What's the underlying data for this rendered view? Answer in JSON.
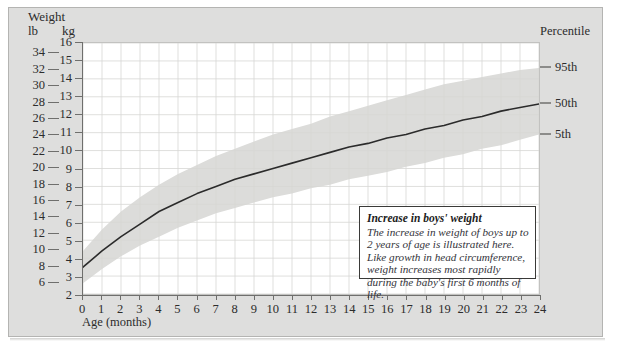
{
  "card": {
    "background_color": "#dededd",
    "border_color": "#b4b4b2"
  },
  "header": {
    "weight_label": "Weight",
    "lb_label": "lb",
    "kg_label": "kg",
    "percentile_label": "Percentile"
  },
  "axes": {
    "x_title": "Age (months)",
    "x_ticks": [
      0,
      1,
      2,
      3,
      4,
      5,
      6,
      7,
      8,
      9,
      10,
      11,
      12,
      13,
      14,
      15,
      16,
      17,
      18,
      19,
      20,
      21,
      22,
      23,
      24
    ],
    "kg_ticks": [
      2,
      3,
      4,
      5,
      6,
      7,
      8,
      9,
      10,
      11,
      12,
      13,
      14,
      15,
      16
    ],
    "lb_ticks": [
      6,
      8,
      10,
      12,
      14,
      16,
      18,
      20,
      22,
      24,
      26,
      28,
      30,
      32,
      34
    ]
  },
  "percentiles": [
    {
      "label": "95th",
      "kg_at_24mo": 14.6
    },
    {
      "label": "50th",
      "kg_at_24mo": 12.6
    },
    {
      "label": "5th",
      "kg_at_24mo": 10.9
    }
  ],
  "callout": {
    "title": "Increase in boys' weight",
    "body": "The increase in weight of boys up to 2 years of age is illustrated here. Like growth in head circumference, weight increases most rapidly during the baby's first 6 months of life."
  },
  "colors": {
    "curve": "#2b2b2b",
    "band": "#dcdcda",
    "gridline": "#d6d6d4",
    "axis": "#6f6f6d",
    "plot_background": "#ffffff"
  },
  "chart_data": {
    "type": "line",
    "title": "Increase in boys' weight",
    "xlabel": "Age (months)",
    "ylabel": "Weight",
    "xlim": [
      0,
      24
    ],
    "ylim": [
      2,
      16
    ],
    "y_unit_primary": "kg",
    "y_unit_secondary": "lb",
    "grid": true,
    "legend_position": "right-axis-labels",
    "x": [
      0,
      1,
      2,
      3,
      4,
      5,
      6,
      7,
      8,
      9,
      10,
      11,
      12,
      13,
      14,
      15,
      16,
      17,
      18,
      19,
      20,
      21,
      22,
      23,
      24
    ],
    "series": [
      {
        "name": "50th",
        "style": "solid-line",
        "values": [
          3.5,
          4.4,
          5.2,
          5.9,
          6.6,
          7.1,
          7.6,
          8.0,
          8.4,
          8.7,
          9.0,
          9.3,
          9.6,
          9.9,
          10.2,
          10.4,
          10.7,
          10.9,
          11.2,
          11.4,
          11.7,
          11.9,
          12.2,
          12.4,
          12.6
        ]
      },
      {
        "name": "95th",
        "style": "band-upper",
        "values": [
          4.4,
          5.6,
          6.6,
          7.4,
          8.1,
          8.7,
          9.2,
          9.7,
          10.1,
          10.5,
          10.9,
          11.2,
          11.5,
          11.9,
          12.2,
          12.5,
          12.8,
          13.1,
          13.4,
          13.7,
          13.9,
          14.1,
          14.3,
          14.5,
          14.6
        ]
      },
      {
        "name": "5th",
        "style": "band-lower",
        "values": [
          2.6,
          3.4,
          4.1,
          4.7,
          5.2,
          5.7,
          6.1,
          6.5,
          6.8,
          7.1,
          7.4,
          7.6,
          7.9,
          8.1,
          8.4,
          8.6,
          8.8,
          9.1,
          9.3,
          9.6,
          9.8,
          10.1,
          10.3,
          10.6,
          10.9
        ]
      }
    ]
  }
}
